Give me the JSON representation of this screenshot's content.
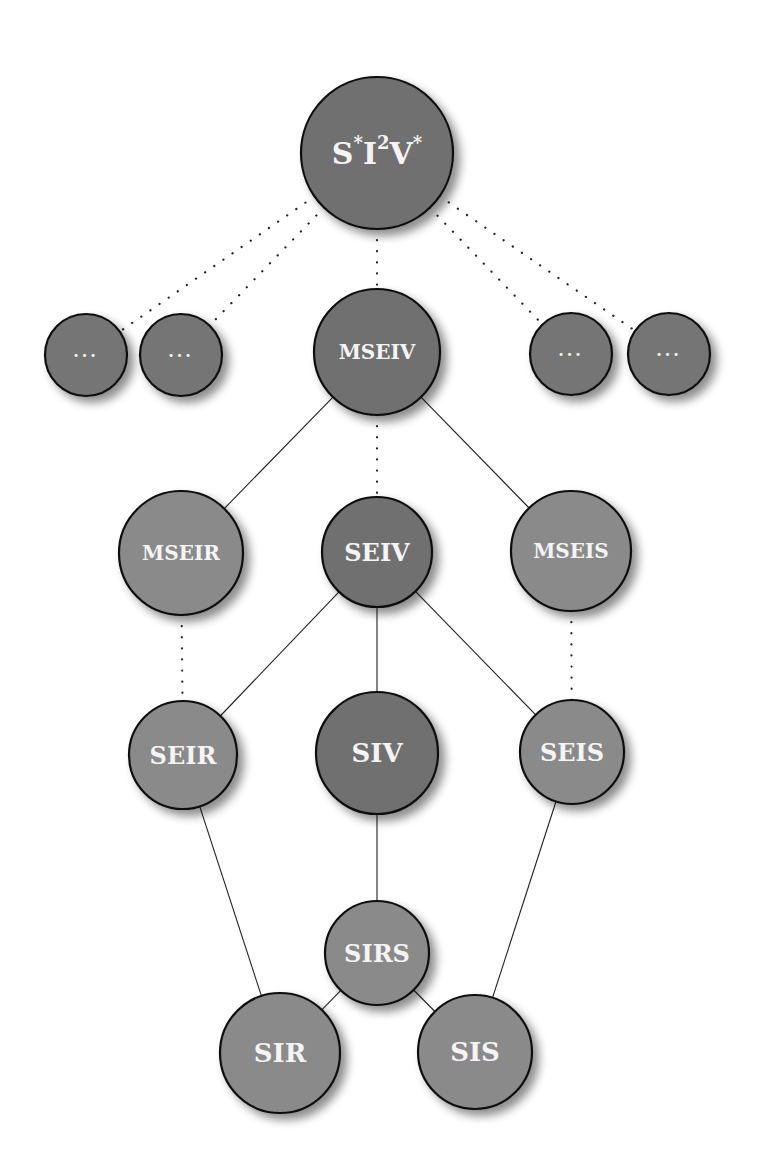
{
  "diagram": {
    "type": "model-hierarchy",
    "colors": {
      "dark_node": "#6f6f6f",
      "small_node": "#747474",
      "light_node": "#8a8a8a",
      "stroke": "#111111",
      "edge": "#222222",
      "label": "#f4f4f4"
    },
    "nodes": [
      {
        "id": "s_i2_v",
        "label": "S*I²V*",
        "label_parts": [
          "S",
          "*",
          "I",
          "2",
          "V",
          "*"
        ],
        "cx": 377,
        "cy": 153,
        "r": 76,
        "shade": "dark",
        "font_size": 30
      },
      {
        "id": "ellipsis_1",
        "label": "···",
        "cx": 86,
        "cy": 355,
        "r": 41,
        "shade": "small",
        "font_size": 16
      },
      {
        "id": "ellipsis_2",
        "label": "···",
        "cx": 181,
        "cy": 355,
        "r": 41,
        "shade": "small",
        "font_size": 16
      },
      {
        "id": "mseiv",
        "label": "MSEIV",
        "cx": 377,
        "cy": 352,
        "r": 63,
        "shade": "dark",
        "font_size": 20
      },
      {
        "id": "ellipsis_3",
        "label": "···",
        "cx": 571,
        "cy": 354,
        "r": 41,
        "shade": "small",
        "font_size": 16
      },
      {
        "id": "ellipsis_4",
        "label": "···",
        "cx": 669,
        "cy": 354,
        "r": 41,
        "shade": "small",
        "font_size": 16
      },
      {
        "id": "mseir",
        "label": "MSEIR",
        "cx": 181,
        "cy": 553,
        "r": 62,
        "shade": "light",
        "font_size": 20
      },
      {
        "id": "seiv",
        "label": "SEIV",
        "cx": 377,
        "cy": 552,
        "r": 55,
        "shade": "dark",
        "font_size": 24
      },
      {
        "id": "mseis",
        "label": "MSEIS",
        "cx": 571,
        "cy": 551,
        "r": 60,
        "shade": "light",
        "font_size": 20
      },
      {
        "id": "seir",
        "label": "SEIR",
        "cx": 183,
        "cy": 755,
        "r": 54,
        "shade": "light",
        "font_size": 24
      },
      {
        "id": "siv",
        "label": "SIV",
        "cx": 377,
        "cy": 753,
        "r": 61,
        "shade": "dark",
        "font_size": 26
      },
      {
        "id": "seis",
        "label": "SEIS",
        "cx": 572,
        "cy": 752,
        "r": 52,
        "shade": "light",
        "font_size": 24
      },
      {
        "id": "sirs",
        "label": "SIRS",
        "cx": 377,
        "cy": 953,
        "r": 52,
        "shade": "light",
        "font_size": 24
      },
      {
        "id": "sir",
        "label": "SIR",
        "cx": 280,
        "cy": 1053,
        "r": 60,
        "shade": "light",
        "font_size": 26
      },
      {
        "id": "sis",
        "label": "SIS",
        "cx": 475,
        "cy": 1052,
        "r": 57,
        "shade": "light",
        "font_size": 26
      }
    ],
    "edges": [
      {
        "from": "s_i2_v",
        "to": "ellipsis_1",
        "style": "dotted"
      },
      {
        "from": "s_i2_v",
        "to": "ellipsis_2",
        "style": "dotted"
      },
      {
        "from": "s_i2_v",
        "to": "mseiv",
        "style": "dotted"
      },
      {
        "from": "s_i2_v",
        "to": "ellipsis_3",
        "style": "dotted"
      },
      {
        "from": "s_i2_v",
        "to": "ellipsis_4",
        "style": "dotted"
      },
      {
        "from": "mseiv",
        "to": "mseir",
        "style": "solid"
      },
      {
        "from": "mseiv",
        "to": "seiv",
        "style": "dotted"
      },
      {
        "from": "mseiv",
        "to": "mseis",
        "style": "solid"
      },
      {
        "from": "mseir",
        "to": "seir",
        "style": "dotted"
      },
      {
        "from": "mseis",
        "to": "seis",
        "style": "dotted"
      },
      {
        "from": "seiv",
        "to": "seir",
        "style": "solid"
      },
      {
        "from": "seiv",
        "to": "siv",
        "style": "solid"
      },
      {
        "from": "seiv",
        "to": "seis",
        "style": "solid"
      },
      {
        "from": "siv",
        "to": "sirs",
        "style": "solid"
      },
      {
        "from": "seir",
        "to": "sir",
        "style": "solid"
      },
      {
        "from": "seis",
        "to": "sis",
        "style": "solid"
      },
      {
        "from": "sirs",
        "to": "sir",
        "style": "solid"
      },
      {
        "from": "sirs",
        "to": "sis",
        "style": "solid"
      }
    ]
  }
}
